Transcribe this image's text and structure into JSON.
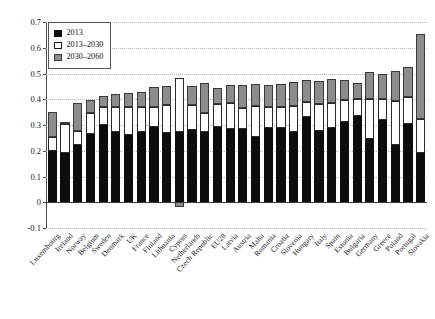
{
  "chart_data": {
    "type": "bar",
    "stacked": true,
    "title": "",
    "subtitle": "",
    "xlabel": "",
    "ylabel": "",
    "ylim": [
      -0.1,
      0.7
    ],
    "yticks": [
      -0.1,
      0,
      0.1,
      0.2,
      0.3,
      0.4,
      0.5,
      0.6,
      0.7
    ],
    "ytick_labels": [
      "-0.1",
      "0",
      "0.1",
      "0.2",
      "0.3",
      "0.4",
      "0.5",
      "0.6",
      "0.7"
    ],
    "grid": true,
    "grid_axis": "y",
    "legend_position": "upper-left",
    "legend_entries": [
      "2013",
      "2013–2030",
      "2030–2060"
    ],
    "categories": [
      "Luxembourg",
      "Ireland",
      "Norway",
      "Belgium",
      "Sweden",
      "Denmark",
      "UK",
      "France",
      "Finland",
      "Lithuania",
      "Cyprus",
      "Netherlands",
      "Czech Republic",
      "EU28",
      "Latvia",
      "Austria",
      "Malta",
      "Romania",
      "Croatia",
      "Slovenia",
      "Hungary",
      "Italy",
      "Spain",
      "Estonia",
      "Bulgaria",
      "Germany",
      "Greece",
      "Poland",
      "Portugal",
      "Slovakia"
    ],
    "series": [
      {
        "name": "2013",
        "color": "#0d0d0d",
        "values": [
          0.2,
          0.19,
          0.222,
          0.265,
          0.3,
          0.272,
          0.262,
          0.272,
          0.293,
          0.268,
          0.272,
          0.282,
          0.272,
          0.292,
          0.285,
          0.283,
          0.255,
          0.29,
          0.288,
          0.272,
          0.33,
          0.278,
          0.287,
          0.313,
          0.335,
          0.246,
          0.32,
          0.222,
          0.302,
          0.19
        ]
      },
      {
        "name": "2013–2030",
        "color": "#ffffff",
        "values": [
          0.052,
          0.113,
          0.055,
          0.08,
          0.07,
          0.097,
          0.108,
          0.098,
          0.078,
          0.108,
          0.212,
          0.095,
          0.075,
          0.09,
          0.1,
          0.083,
          0.12,
          0.08,
          0.082,
          0.1,
          0.06,
          0.102,
          0.098,
          0.083,
          0.065,
          0.155,
          0.08,
          0.17,
          0.105,
          0.135
        ]
      },
      {
        "name": "2030–2060",
        "color": "#8c8c8c",
        "values": [
          0.1,
          0.007,
          0.11,
          0.052,
          0.043,
          0.05,
          0.055,
          0.06,
          0.075,
          0.075,
          -0.017,
          0.075,
          0.115,
          0.062,
          0.072,
          0.09,
          0.085,
          0.085,
          0.09,
          0.095,
          0.085,
          0.09,
          0.095,
          0.08,
          0.065,
          0.105,
          0.1,
          0.118,
          0.12,
          0.33
        ]
      }
    ]
  }
}
